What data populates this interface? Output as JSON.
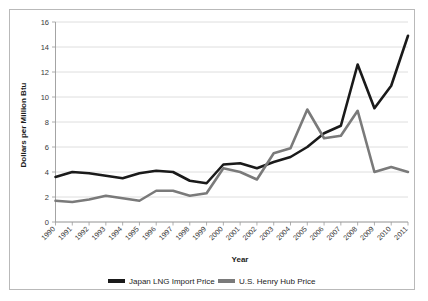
{
  "chart_data": {
    "type": "line",
    "title": "",
    "xlabel": "Year",
    "ylabel": "Dollars per Million Btu",
    "categories": [
      "1990",
      "1991",
      "1992",
      "1993",
      "1994",
      "1995",
      "1996",
      "1997",
      "1998",
      "1999",
      "2000",
      "2001",
      "2002",
      "2003",
      "2004",
      "2005",
      "2006",
      "2007",
      "2008",
      "2009",
      "2010",
      "2011"
    ],
    "x": [
      1990,
      1991,
      1992,
      1993,
      1994,
      1995,
      1996,
      1997,
      1998,
      1999,
      2000,
      2001,
      2002,
      2003,
      2004,
      2005,
      2006,
      2007,
      2008,
      2009,
      2010,
      2011
    ],
    "ylim": [
      0,
      16
    ],
    "xlim": [
      1990,
      2011
    ],
    "yticks": [
      0,
      2,
      4,
      6,
      8,
      10,
      12,
      14,
      16
    ],
    "ytick_labels": [
      "0",
      "2",
      "4",
      "6",
      "8",
      "10",
      "12",
      "14",
      "16"
    ],
    "grid": true,
    "legend_position": "bottom",
    "series": [
      {
        "name": "Japan LNG Import Price",
        "color": "#1a1a1a",
        "values": [
          3.6,
          4.0,
          3.9,
          3.7,
          3.5,
          3.9,
          4.1,
          4.0,
          3.3,
          3.1,
          4.6,
          4.7,
          4.3,
          4.8,
          5.2,
          6.0,
          7.1,
          7.7,
          12.6,
          9.1,
          10.9,
          14.9
        ]
      },
      {
        "name": "U.S. Henry Hub Price",
        "color": "#7a7a7a",
        "values": [
          1.7,
          1.6,
          1.8,
          2.1,
          1.9,
          1.7,
          2.5,
          2.5,
          2.1,
          2.3,
          4.3,
          4.0,
          3.4,
          5.5,
          5.9,
          9.0,
          6.7,
          6.9,
          8.9,
          4.0,
          4.4,
          4.0
        ]
      }
    ]
  },
  "legend": {
    "items": [
      {
        "label": "Japan LNG Import Price",
        "color": "#1a1a1a"
      },
      {
        "label": "U.S. Henry Hub Price",
        "color": "#7a7a7a"
      }
    ]
  }
}
